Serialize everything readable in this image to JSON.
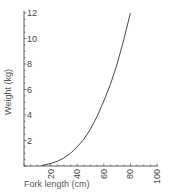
{
  "chart_data": {
    "type": "line",
    "title": "",
    "xlabel": "Fork length (cm)",
    "ylabel": "Weight (kg)",
    "xlim": [
      0,
      100
    ],
    "ylim": [
      0,
      12
    ],
    "grid": false,
    "legend": null,
    "x_ticks": [
      20,
      40,
      60,
      80,
      100
    ],
    "y_ticks": [
      2,
      4,
      6,
      8,
      10,
      12
    ],
    "series": [
      {
        "name": "Weight vs fork length",
        "x": [
          15,
          20,
          25,
          30,
          35,
          40,
          45,
          50,
          55,
          60,
          65,
          70,
          75,
          80
        ],
        "y": [
          0.08,
          0.19,
          0.37,
          0.63,
          1.0,
          1.5,
          2.1,
          2.9,
          3.9,
          5.1,
          6.4,
          8.0,
          9.9,
          12.0
        ]
      }
    ],
    "colors": {
      "line": "#333333",
      "axis": "#333333"
    }
  }
}
